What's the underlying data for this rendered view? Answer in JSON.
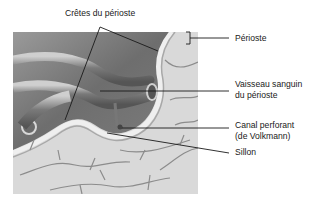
{
  "figure": {
    "labels": {
      "cretes": "Crêtes du périoste",
      "perioste": "Périoste",
      "vaisseau_line1": "Vaisseau sanguin",
      "vaisseau_line2": "du périoste",
      "canal_line1": "Canal perforant",
      "canal_line2": "(de Volkmann)",
      "sillon": "Sillon"
    },
    "colors": {
      "background": "#ffffff",
      "bone_surface": "#d6d6d6",
      "vessel_dark": "#5e5e5e",
      "vessel_mid": "#8a8a8a",
      "periosteum_band": "#b8b8b8",
      "leader_line": "#1a1a1a"
    }
  }
}
